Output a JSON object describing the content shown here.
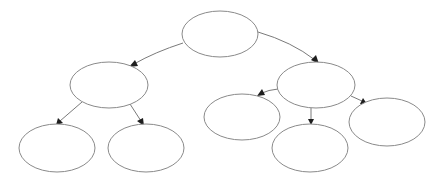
{
  "diagram": {
    "type": "tree",
    "colors": {
      "node_stroke": "#8a8a8a",
      "node_fill": "#ffffff",
      "edge": "#7a7a7a",
      "arrow": "#1e1e1e",
      "background": "#ffffff"
    },
    "nodes": [
      {
        "id": "root",
        "label": "",
        "cx": 220,
        "cy": 34,
        "rx": 38,
        "ry": 23
      },
      {
        "id": "left-mid",
        "label": "",
        "cx": 109,
        "cy": 85,
        "rx": 39,
        "ry": 23
      },
      {
        "id": "right-mid",
        "label": "",
        "cx": 316,
        "cy": 85,
        "rx": 39,
        "ry": 23
      },
      {
        "id": "left-left",
        "label": "",
        "cx": 57,
        "cy": 148,
        "rx": 38,
        "ry": 24
      },
      {
        "id": "left-right",
        "label": "",
        "cx": 146,
        "cy": 148,
        "rx": 38,
        "ry": 24
      },
      {
        "id": "right-left",
        "label": "",
        "cx": 242,
        "cy": 117,
        "rx": 38,
        "ry": 23
      },
      {
        "id": "right-center",
        "label": "",
        "cx": 310,
        "cy": 148,
        "rx": 38,
        "ry": 24
      },
      {
        "id": "right-right",
        "label": "",
        "cx": 387,
        "cy": 122,
        "rx": 38,
        "ry": 24
      }
    ],
    "edges": [
      {
        "from": "root",
        "to": "left-mid"
      },
      {
        "from": "root",
        "to": "right-mid"
      },
      {
        "from": "left-mid",
        "to": "left-left"
      },
      {
        "from": "left-mid",
        "to": "left-right"
      },
      {
        "from": "right-mid",
        "to": "right-left"
      },
      {
        "from": "right-mid",
        "to": "right-center"
      },
      {
        "from": "right-mid",
        "to": "right-right"
      }
    ]
  }
}
